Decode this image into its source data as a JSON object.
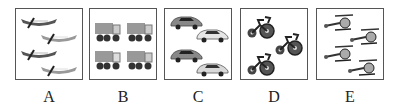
{
  "options": [
    {
      "label": "A",
      "content": "canoes",
      "count": 4
    },
    {
      "label": "B",
      "content": "dump-trucks",
      "count": 4
    },
    {
      "label": "C",
      "content": "cars",
      "count": 4
    },
    {
      "label": "D",
      "content": "tricycles",
      "count": 3
    },
    {
      "label": "E",
      "content": "helicopters",
      "count": 4
    }
  ]
}
